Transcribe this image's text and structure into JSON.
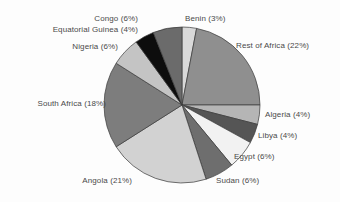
{
  "chart_data": {
    "type": "pie",
    "title": "",
    "subtitle": "",
    "xlabel": "",
    "ylabel": "",
    "legend_position": "none",
    "grid": false,
    "labels_show_percent": true,
    "start_angle_deg": 0,
    "direction": "clockwise",
    "categories": [
      "Benin",
      "Rest of Africa",
      "Algeria",
      "Libya",
      "Egypt",
      "Sudan",
      "Angola",
      "South Africa",
      "Nigeria",
      "Equatorial Guinea",
      "Congo"
    ],
    "values": [
      3,
      22,
      4,
      4,
      6,
      6,
      21,
      18,
      6,
      4,
      6
    ],
    "units": "percent",
    "total": 100,
    "slices": [
      {
        "name": "Benin",
        "value": 3,
        "label": "Benin (3%)",
        "color": "#d9d9d9"
      },
      {
        "name": "Rest of Africa",
        "value": 22,
        "label": "Rest of Africa (22%)",
        "color": "#8f8f8f"
      },
      {
        "name": "Algeria",
        "value": 4,
        "label": "Algeria (4%)",
        "color": "#b5b5b5"
      },
      {
        "name": "Libya",
        "value": 4,
        "label": "Libya (4%)",
        "color": "#555555"
      },
      {
        "name": "Egypt",
        "value": 6,
        "label": "Egypt (6%)",
        "color": "#f2f2f2"
      },
      {
        "name": "Sudan",
        "value": 6,
        "label": "Sudan (6%)",
        "color": "#6e6e6e"
      },
      {
        "name": "Angola",
        "value": 21,
        "label": "Angola (21%)",
        "color": "#d2d2d2"
      },
      {
        "name": "South Africa",
        "value": 18,
        "label": "South Africa (18%)",
        "color": "#7d7d7d"
      },
      {
        "name": "Nigeria",
        "value": 6,
        "label": "Nigeria (6%)",
        "color": "#c4c4c4"
      },
      {
        "name": "Equatorial Guinea",
        "value": 4,
        "label": "Equatorial Guinea (4%)",
        "color": "#0d0d0d"
      },
      {
        "name": "Congo",
        "value": 6,
        "label": "Congo (6%)",
        "color": "#6b6b6b"
      }
    ]
  },
  "labels": {
    "benin": "Benin (3%)",
    "rest_of_africa": "Rest of Africa (22%)",
    "algeria": "Algeria (4%)",
    "libya": "Libya (4%)",
    "egypt": "Egypt (6%)",
    "sudan": "Sudan (6%)",
    "angola": "Angola (21%)",
    "south_africa": "South Africa (18%)",
    "nigeria": "Nigeria (6%)",
    "equatorial_guinea": "Equatorial Guinea (4%)",
    "congo": "Congo (6%)"
  },
  "style": {
    "background": "#fdfdfd",
    "text_color": "#4a4a4a",
    "slice_outline": "#3a3a3a"
  }
}
